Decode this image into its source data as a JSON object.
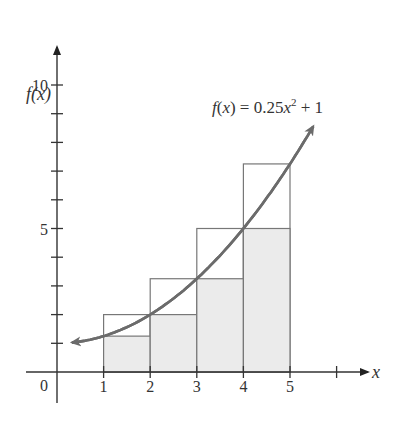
{
  "chart_data": {
    "type": "bar",
    "title": "",
    "function_label": "f(x) = 0.25x² + 1",
    "function": {
      "a": 0.25,
      "b": 0,
      "c": 1,
      "domain": [
        0.32,
        5.5
      ]
    },
    "xlabel": "x",
    "ylabel": "f(x)",
    "origin_label": "0",
    "xlim": [
      0,
      6
    ],
    "ylim": [
      0,
      10
    ],
    "x_ticks": [
      1,
      2,
      3,
      4,
      5,
      6
    ],
    "x_tick_labels": [
      "1",
      "2",
      "3",
      "4",
      "5"
    ],
    "y_ticks": [
      1,
      2,
      3,
      4,
      5,
      6,
      7,
      8,
      9,
      10
    ],
    "y_tick_labels": [
      {
        "value": 5,
        "label": "5"
      },
      {
        "value": 10,
        "label": "10"
      }
    ],
    "grid": false,
    "series": [
      {
        "name": "inscribed rectangles (shaded, left endpoints)",
        "intervals": [
          [
            1,
            2
          ],
          [
            2,
            3
          ],
          [
            3,
            4
          ],
          [
            4,
            5
          ]
        ],
        "values": [
          1.25,
          2,
          3.25,
          5
        ],
        "fill": "#ebebeb"
      },
      {
        "name": "circumscribed rectangles (outlined, right endpoints)",
        "intervals": [
          [
            1,
            2
          ],
          [
            2,
            3
          ],
          [
            3,
            4
          ],
          [
            4,
            5
          ]
        ],
        "values": [
          2,
          3.25,
          5,
          7.25
        ],
        "fill": "none"
      }
    ],
    "colors": {
      "curve": "#6b6b6b",
      "axis": "#333333",
      "rect_stroke": "#777777",
      "shade": "#ebebeb"
    }
  }
}
